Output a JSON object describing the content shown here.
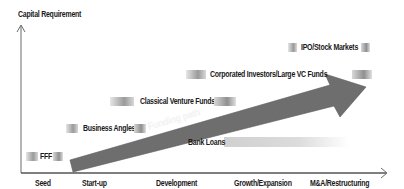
{
  "diagram": {
    "y_axis_label": "Capital Requirement",
    "x_axis_stages": [
      "Seed",
      "Start-up",
      "Development",
      "Growth/Expansion",
      "M&A/Restructuring"
    ],
    "arrow_label": "Funding path",
    "funding_sources": [
      {
        "label": "FFF"
      },
      {
        "label": "Business Angles"
      },
      {
        "label": "Classical Venture Funds"
      },
      {
        "label": "Corporated Investors/Large VC Funds"
      },
      {
        "label": "IPO/Stock Markets"
      },
      {
        "label": "Bank Loans"
      }
    ],
    "colors": {
      "arrow": "#6e6e6e",
      "bars": "#9a9a9a",
      "axis": "#555555",
      "text": "#1a1a1a"
    }
  }
}
